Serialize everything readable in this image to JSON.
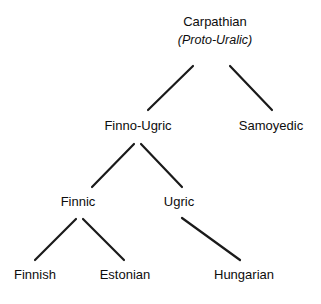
{
  "diagram": {
    "title_node": {
      "label": "Carpathian",
      "subtitle": "(Proto-Uralic)"
    },
    "colors": {
      "background": "#ffffff",
      "text": "#0d0d0d",
      "edge": "#1a1a1a"
    },
    "nodes": [
      {
        "id": "carpathian",
        "label": "Carpathian",
        "subtitle": "(Proto-Uralic)",
        "level": 0,
        "x": 215,
        "y": 14
      },
      {
        "id": "finno-ugric",
        "label": "Finno-Ugric",
        "level": 1,
        "x": 138,
        "y": 118
      },
      {
        "id": "samoyedic",
        "label": "Samoyedic",
        "level": 1,
        "x": 271,
        "y": 118
      },
      {
        "id": "finnic",
        "label": "Finnic",
        "level": 2,
        "x": 78,
        "y": 194
      },
      {
        "id": "ugric",
        "label": "Ugric",
        "level": 2,
        "x": 179,
        "y": 194
      },
      {
        "id": "finnish",
        "label": "Finnish",
        "level": 3,
        "x": 35,
        "y": 267
      },
      {
        "id": "estonian",
        "label": "Estonian",
        "level": 3,
        "x": 125,
        "y": 267
      },
      {
        "id": "hungarian",
        "label": "Hungarian",
        "level": 3,
        "x": 244,
        "y": 267
      }
    ],
    "edges": [
      {
        "id": "carpathian-finno-ugric",
        "from": "carpathian",
        "to": "finno-ugric",
        "x1": 193,
        "y1": 66,
        "x2": 148,
        "y2": 110
      },
      {
        "id": "carpathian-samoyedic",
        "from": "carpathian",
        "to": "samoyedic",
        "x1": 230,
        "y1": 66,
        "x2": 272,
        "y2": 110
      },
      {
        "id": "finno-ugric-finnic",
        "from": "finno-ugric",
        "to": "finnic",
        "x1": 134,
        "y1": 144,
        "x2": 92,
        "y2": 187
      },
      {
        "id": "finno-ugric-ugric",
        "from": "finno-ugric",
        "to": "ugric",
        "x1": 141,
        "y1": 144,
        "x2": 182,
        "y2": 187
      },
      {
        "id": "finnic-finnish",
        "from": "finnic",
        "to": "finnish",
        "x1": 76,
        "y1": 219,
        "x2": 35,
        "y2": 260
      },
      {
        "id": "finnic-estonian",
        "from": "finnic",
        "to": "estonian",
        "x1": 83,
        "y1": 219,
        "x2": 124,
        "y2": 260
      },
      {
        "id": "ugric-hungarian",
        "from": "ugric",
        "to": "hungarian",
        "x1": 182,
        "y1": 218,
        "x2": 240,
        "y2": 260
      }
    ]
  }
}
